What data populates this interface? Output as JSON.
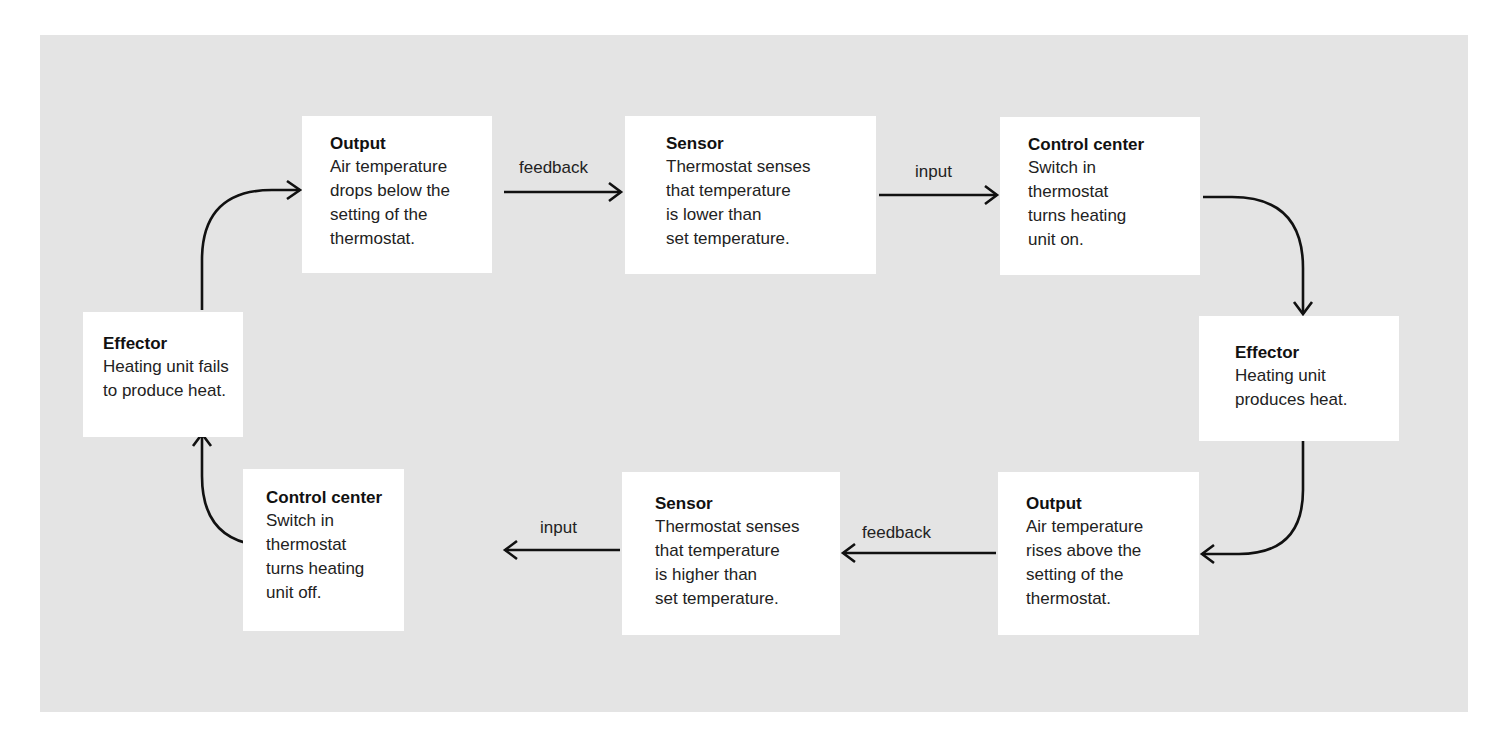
{
  "diagram": {
    "nodes": [
      {
        "id": "output-top",
        "title": "Output",
        "text": "Air temperature\ndrops below the\nsetting of the\nthermostat."
      },
      {
        "id": "sensor-top",
        "title": "Sensor",
        "text": "Thermostat senses\nthat temperature\nis lower than\nset temperature."
      },
      {
        "id": "control-top",
        "title": "Control center",
        "text": "Switch in\nthermostat\nturns heating\nunit on."
      },
      {
        "id": "effector-right",
        "title": "Effector",
        "text": "Heating unit\nproduces heat."
      },
      {
        "id": "output-bottom",
        "title": "Output",
        "text": "Air temperature\nrises above the\nsetting of the\nthermostat."
      },
      {
        "id": "sensor-bottom",
        "title": "Sensor",
        "text": "Thermostat senses\nthat temperature\nis higher than\nset temperature."
      },
      {
        "id": "control-bottom",
        "title": "Control center",
        "text": "Switch in\nthermostat\nturns heating\nunit off."
      },
      {
        "id": "effector-left",
        "title": "Effector",
        "text": "Heating unit fails\nto produce heat."
      }
    ],
    "edge_labels": {
      "top_feedback": "feedback",
      "top_input": "input",
      "bottom_feedback": "feedback",
      "bottom_input": "input"
    },
    "edges": [
      {
        "from": "output-top",
        "to": "sensor-top",
        "label": "feedback"
      },
      {
        "from": "sensor-top",
        "to": "control-top",
        "label": "input"
      },
      {
        "from": "control-top",
        "to": "effector-right",
        "label": ""
      },
      {
        "from": "effector-right",
        "to": "output-bottom",
        "label": ""
      },
      {
        "from": "output-bottom",
        "to": "sensor-bottom",
        "label": "feedback"
      },
      {
        "from": "sensor-bottom",
        "to": "control-bottom",
        "label": "input"
      },
      {
        "from": "control-bottom",
        "to": "effector-left",
        "label": ""
      },
      {
        "from": "effector-left",
        "to": "output-top",
        "label": ""
      }
    ],
    "colors": {
      "panel": "#e4e4e4",
      "box": "#ffffff",
      "stroke": "#111111"
    }
  }
}
